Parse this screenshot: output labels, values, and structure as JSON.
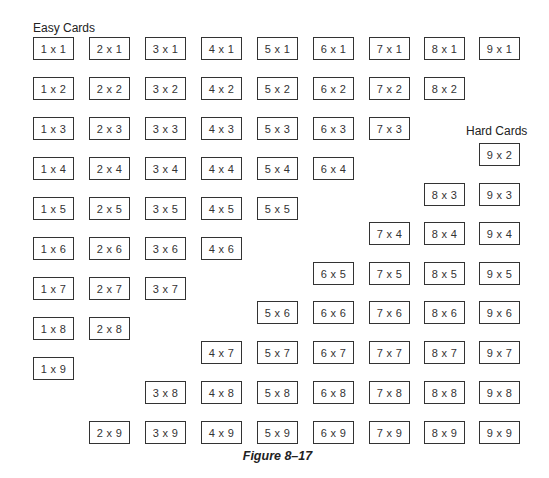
{
  "labels": {
    "easy": "Easy Cards",
    "hard": "Hard Cards",
    "caption": "Figure 8–17"
  },
  "layout": {
    "col_x": [
      33,
      89,
      145,
      201,
      257,
      313,
      369,
      424,
      479
    ],
    "easy_row_y": [
      37,
      77,
      117,
      157,
      197,
      237,
      277,
      317,
      357
    ],
    "hard_row_y": [
      null,
      143,
      183,
      222,
      262,
      301,
      341,
      381,
      421
    ]
  },
  "easy_cards": [
    {
      "a": 1,
      "b": 1,
      "text": "1 x 1"
    },
    {
      "a": 2,
      "b": 1,
      "text": "2 x 1"
    },
    {
      "a": 3,
      "b": 1,
      "text": "3 x 1"
    },
    {
      "a": 4,
      "b": 1,
      "text": "4 x 1"
    },
    {
      "a": 5,
      "b": 1,
      "text": "5 x 1"
    },
    {
      "a": 6,
      "b": 1,
      "text": "6 x 1"
    },
    {
      "a": 7,
      "b": 1,
      "text": "7 x 1"
    },
    {
      "a": 8,
      "b": 1,
      "text": "8 x 1"
    },
    {
      "a": 9,
      "b": 1,
      "text": "9 x 1"
    },
    {
      "a": 1,
      "b": 2,
      "text": "1 x 2"
    },
    {
      "a": 2,
      "b": 2,
      "text": "2 x 2"
    },
    {
      "a": 3,
      "b": 2,
      "text": "3 x 2"
    },
    {
      "a": 4,
      "b": 2,
      "text": "4 x 2"
    },
    {
      "a": 5,
      "b": 2,
      "text": "5 x 2"
    },
    {
      "a": 6,
      "b": 2,
      "text": "6 x 2"
    },
    {
      "a": 7,
      "b": 2,
      "text": "7 x 2"
    },
    {
      "a": 8,
      "b": 2,
      "text": "8 x 2"
    },
    {
      "a": 1,
      "b": 3,
      "text": "1 x 3"
    },
    {
      "a": 2,
      "b": 3,
      "text": "2 x 3"
    },
    {
      "a": 3,
      "b": 3,
      "text": "3 x 3"
    },
    {
      "a": 4,
      "b": 3,
      "text": "4 x 3"
    },
    {
      "a": 5,
      "b": 3,
      "text": "5 x 3"
    },
    {
      "a": 6,
      "b": 3,
      "text": "6 x 3"
    },
    {
      "a": 7,
      "b": 3,
      "text": "7 x 3"
    },
    {
      "a": 1,
      "b": 4,
      "text": "1 x 4"
    },
    {
      "a": 2,
      "b": 4,
      "text": "2 x 4"
    },
    {
      "a": 3,
      "b": 4,
      "text": "3 x 4"
    },
    {
      "a": 4,
      "b": 4,
      "text": "4 x 4"
    },
    {
      "a": 5,
      "b": 4,
      "text": "5 x 4"
    },
    {
      "a": 6,
      "b": 4,
      "text": "6 x 4"
    },
    {
      "a": 1,
      "b": 5,
      "text": "1 x 5"
    },
    {
      "a": 2,
      "b": 5,
      "text": "2 x 5"
    },
    {
      "a": 3,
      "b": 5,
      "text": "3 x 5"
    },
    {
      "a": 4,
      "b": 5,
      "text": "4 x 5"
    },
    {
      "a": 5,
      "b": 5,
      "text": "5 x 5"
    },
    {
      "a": 1,
      "b": 6,
      "text": "1 x 6"
    },
    {
      "a": 2,
      "b": 6,
      "text": "2 x 6"
    },
    {
      "a": 3,
      "b": 6,
      "text": "3 x 6"
    },
    {
      "a": 4,
      "b": 6,
      "text": "4 x 6"
    },
    {
      "a": 1,
      "b": 7,
      "text": "1 x 7"
    },
    {
      "a": 2,
      "b": 7,
      "text": "2 x 7"
    },
    {
      "a": 3,
      "b": 7,
      "text": "3 x 7"
    },
    {
      "a": 1,
      "b": 8,
      "text": "1 x 8"
    },
    {
      "a": 2,
      "b": 8,
      "text": "2 x 8"
    },
    {
      "a": 1,
      "b": 9,
      "text": "1 x 9"
    }
  ],
  "hard_cards": [
    {
      "a": 9,
      "b": 2,
      "text": "9 x 2"
    },
    {
      "a": 8,
      "b": 3,
      "text": "8 x 3"
    },
    {
      "a": 9,
      "b": 3,
      "text": "9 x 3"
    },
    {
      "a": 7,
      "b": 4,
      "text": "7 x 4"
    },
    {
      "a": 8,
      "b": 4,
      "text": "8 x 4"
    },
    {
      "a": 9,
      "b": 4,
      "text": "9 x 4"
    },
    {
      "a": 6,
      "b": 5,
      "text": "6 x 5"
    },
    {
      "a": 7,
      "b": 5,
      "text": "7 x 5"
    },
    {
      "a": 8,
      "b": 5,
      "text": "8 x 5"
    },
    {
      "a": 9,
      "b": 5,
      "text": "9 x 5"
    },
    {
      "a": 5,
      "b": 6,
      "text": "5 x 6"
    },
    {
      "a": 6,
      "b": 6,
      "text": "6 x 6"
    },
    {
      "a": 7,
      "b": 6,
      "text": "7 x 6"
    },
    {
      "a": 8,
      "b": 6,
      "text": "8 x 6"
    },
    {
      "a": 9,
      "b": 6,
      "text": "9 x 6"
    },
    {
      "a": 4,
      "b": 7,
      "text": "4 x 7"
    },
    {
      "a": 5,
      "b": 7,
      "text": "5 x 7"
    },
    {
      "a": 6,
      "b": 7,
      "text": "6 x 7"
    },
    {
      "a": 7,
      "b": 7,
      "text": "7 x 7"
    },
    {
      "a": 8,
      "b": 7,
      "text": "8 x 7"
    },
    {
      "a": 9,
      "b": 7,
      "text": "9 x 7"
    },
    {
      "a": 3,
      "b": 8,
      "text": "3 x 8"
    },
    {
      "a": 4,
      "b": 8,
      "text": "4 x 8"
    },
    {
      "a": 5,
      "b": 8,
      "text": "5 x 8"
    },
    {
      "a": 6,
      "b": 8,
      "text": "6 x 8"
    },
    {
      "a": 7,
      "b": 8,
      "text": "7 x 8"
    },
    {
      "a": 8,
      "b": 8,
      "text": "8 x 8"
    },
    {
      "a": 9,
      "b": 8,
      "text": "9 x 8"
    },
    {
      "a": 2,
      "b": 9,
      "text": "2 x 9"
    },
    {
      "a": 3,
      "b": 9,
      "text": "3 x 9"
    },
    {
      "a": 4,
      "b": 9,
      "text": "4 x 9"
    },
    {
      "a": 5,
      "b": 9,
      "text": "5 x 9"
    },
    {
      "a": 6,
      "b": 9,
      "text": "6 x 9"
    },
    {
      "a": 7,
      "b": 9,
      "text": "7 x 9"
    },
    {
      "a": 8,
      "b": 9,
      "text": "8 x 9"
    },
    {
      "a": 9,
      "b": 9,
      "text": "9 x 9"
    }
  ]
}
